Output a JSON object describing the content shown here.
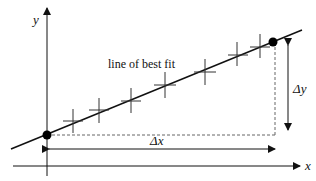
{
  "diagram": {
    "title": "line of best fit",
    "axes": {
      "x_label": "x",
      "y_label": "y"
    },
    "deltas": {
      "dx_label": "Δx",
      "dy_label": "Δy"
    },
    "line_label": "line of best fit",
    "data_points_count": 7,
    "endpoints": [
      "left-filled-dot",
      "right-filled-dot"
    ],
    "colors": {
      "ink": "#111111",
      "dashed": "#666666",
      "background": "#ffffff"
    }
  }
}
